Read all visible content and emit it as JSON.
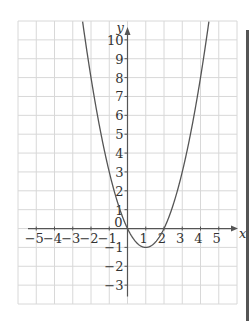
{
  "chart_data": {
    "type": "line",
    "title": "",
    "xlabel": "x",
    "ylabel": "y",
    "xlim": [
      -6,
      6
    ],
    "ylim": [
      -4,
      11
    ],
    "grid": true,
    "x_ticks": [
      -5,
      -4,
      -3,
      -2,
      -1,
      0,
      1,
      2,
      3,
      4,
      5
    ],
    "x_tick_labels": [
      "−5",
      "−4",
      "−3",
      "−2",
      "−1",
      "0",
      "1",
      "2",
      "3",
      "4",
      "5"
    ],
    "y_ticks": [
      -3,
      -2,
      -1,
      1,
      2,
      3,
      4,
      5,
      6,
      7,
      8,
      9,
      10
    ],
    "y_tick_labels": [
      "−3",
      "−2",
      "−1",
      "1",
      "2",
      "3",
      "4",
      "5",
      "6",
      "7",
      "8",
      "9",
      "10"
    ],
    "series": [
      {
        "name": "y = x² − 2x",
        "function": "x^2 - 2x",
        "vertex": [
          1,
          -1
        ],
        "roots": [
          0,
          2
        ],
        "x": [
          -2.3,
          -2,
          -1,
          0,
          1,
          2,
          3,
          4,
          4.3
        ],
        "y": [
          9.89,
          8,
          3,
          0,
          -1,
          0,
          3,
          8,
          9.89
        ]
      }
    ],
    "colors": {
      "curve": "#555555",
      "grid": "#d8d8d8",
      "axis": "#555555"
    }
  }
}
